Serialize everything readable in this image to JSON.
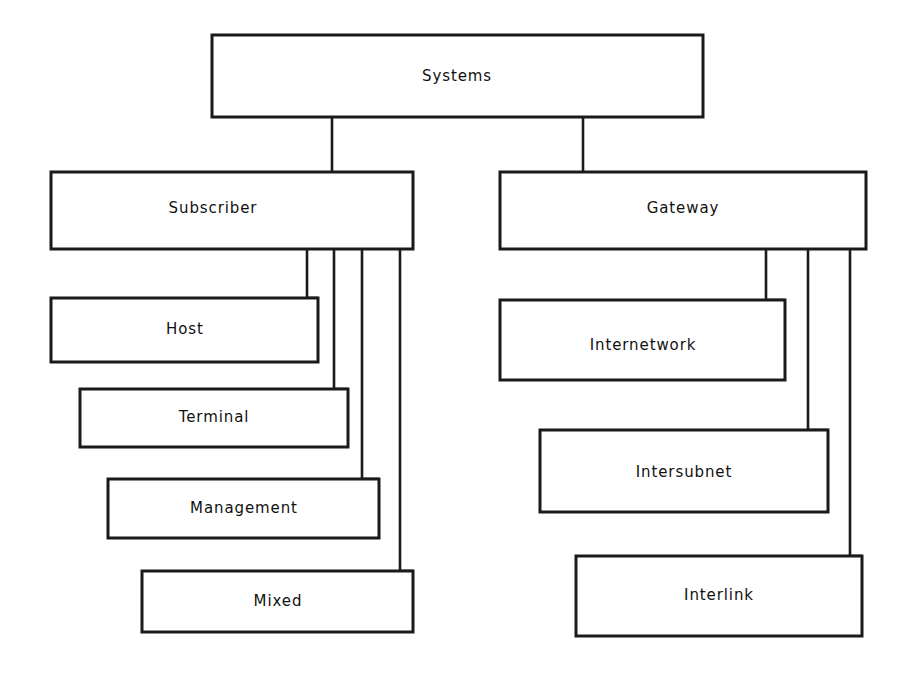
{
  "diagram": {
    "title": "Systems",
    "type": "hierarchy-tree",
    "style": {
      "box_fill": "#ffffff",
      "box_stroke": "#1a1a1a",
      "line_color": "#1a1a1a",
      "text_color": "#111111",
      "background": "#ffffff"
    },
    "root": {
      "id": "systems",
      "label": "Systems",
      "x": 212,
      "y": 35,
      "w": 491,
      "h": 82,
      "label_x": 457,
      "label_y": 76
    },
    "branches": [
      {
        "id": "subscriber",
        "label": "Subscriber",
        "x": 51,
        "y": 172,
        "w": 362,
        "h": 77,
        "label_x": 213,
        "label_y": 208,
        "children": [
          {
            "id": "host",
            "label": "Host",
            "x": 51,
            "y": 298,
            "w": 267,
            "h": 64,
            "label_x": 185,
            "label_y": 329,
            "connector_x": 307
          },
          {
            "id": "terminal",
            "label": "Terminal",
            "x": 80,
            "y": 389,
            "w": 268,
            "h": 58,
            "label_x": 214,
            "label_y": 417,
            "connector_x": 334
          },
          {
            "id": "management",
            "label": "Management",
            "x": 108,
            "y": 479,
            "w": 271,
            "h": 59,
            "label_x": 244,
            "label_y": 508,
            "connector_x": 362
          },
          {
            "id": "mixed",
            "label": "Mixed",
            "x": 142,
            "y": 571,
            "w": 271,
            "h": 61,
            "label_x": 278,
            "label_y": 601,
            "connector_x": 400
          }
        ]
      },
      {
        "id": "gateway",
        "label": "Gateway",
        "x": 500,
        "y": 172,
        "w": 366,
        "h": 77,
        "label_x": 683,
        "label_y": 208,
        "children": [
          {
            "id": "internetwork",
            "label": "Internetwork",
            "x": 500,
            "y": 300,
            "w": 285,
            "h": 80,
            "label_x": 643,
            "label_y": 345,
            "connector_x": 766
          },
          {
            "id": "intersubnet",
            "label": "Intersubnet",
            "x": 540,
            "y": 430,
            "w": 288,
            "h": 82,
            "label_x": 684,
            "label_y": 472,
            "connector_x": 808
          },
          {
            "id": "interlink",
            "label": "Interlink",
            "x": 576,
            "y": 556,
            "w": 286,
            "h": 80,
            "label_x": 719,
            "label_y": 595,
            "connector_x": 850
          }
        ]
      }
    ],
    "root_connectors": [
      {
        "id": "root-to-subscriber",
        "x": 332,
        "y_top": 117,
        "y_bottom": 172
      },
      {
        "id": "root-to-gateway",
        "x": 583,
        "y_top": 117,
        "y_bottom": 172
      }
    ]
  }
}
